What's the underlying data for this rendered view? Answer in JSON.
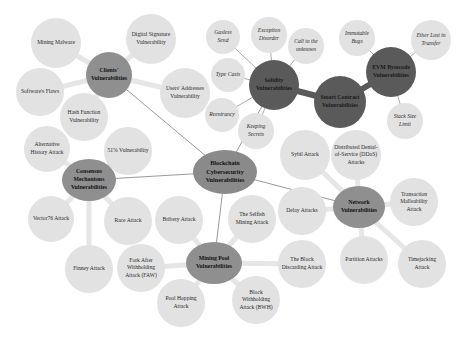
{
  "title": "Blockchain Cybersecurity Vulnerabilities",
  "colors": {
    "leaf_fill": "#e2e2e2",
    "hub_fill": "#8f8f8f",
    "dark_hub_fill": "#5a5a5a",
    "root_fill": "#8a8a8a",
    "edge": "#555555",
    "thick_edge": "#e6e6e6"
  },
  "root": {
    "label": "Blockchain Cybersecurity Vulnerabilities"
  },
  "hubs": {
    "clients": {
      "label": "Clients' Vulnerabilities"
    },
    "smart_contract": {
      "label": "Smart Contract Vulnerabilities"
    },
    "solidity": {
      "label": "Solidity Vulnerabilities"
    },
    "evm": {
      "label": "EVM Bytecode Vulnerabilities"
    },
    "consensus": {
      "label": "Consensus Mechanisms Vulnerabilities"
    },
    "network": {
      "label": "Network Vulnerabilities"
    },
    "mining_pool": {
      "label": "Mining Pool Vulnerabilities"
    }
  },
  "leaves": {
    "mining_malware": "Mining Malware",
    "digital_signature": "Digital Signature Vulnerability",
    "software_flaws": "Software's Flaws",
    "users_addresses": "Users' Addresses Vulnerability",
    "hash_function": "Hash Function Vulnerability",
    "gasless_send": "Gasless Send",
    "exception_disorder": "Exception Disorder",
    "call_unknown": "Call to the unknown",
    "type_casts": "Type Casts",
    "reentrancy": "Reentrancy",
    "keeping_secrets": "Keeping Secrets",
    "immutable_bugs": "Immutable Bugs",
    "ether_lost": "Ether Lost in Transfer",
    "stack_size": "Stack Size Limit",
    "alternative_history": "Alternative History Attack",
    "fifty_one": "51% Vulnerability",
    "vector76": "Vector76 Attack",
    "race_attack": "Race Attack",
    "finney_attack": "Finney Attack",
    "sybil_attack": "Sybil Attack",
    "ddos": "Distributed Denial-of-Service (DDoS) Attacks",
    "delay_attacks": "Delay Attacks",
    "transaction_malleability": "Transaction Malleability Attack",
    "partition_attacks": "Partition Attacks",
    "time_jacking": "Timejacking Attack",
    "bribery_attack": "Bribery Attack",
    "selfish_mining": "The Selfish Mining Attack",
    "block_discarding": "The Block Discarding Attack",
    "faw": "Fork After Withholding Attack (FAW)",
    "pool_hopping": "Pool Hopping Attack",
    "bwh": "Block Withholding Attack (BWH)"
  }
}
